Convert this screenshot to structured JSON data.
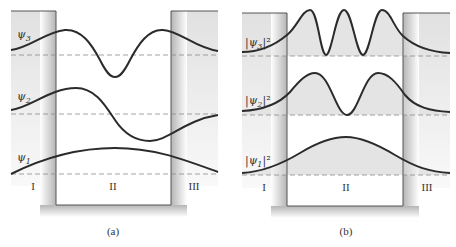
{
  "figure": {
    "panels": [
      {
        "id": "a",
        "caption": "(a)",
        "regions": [
          "I",
          "II",
          "III"
        ],
        "curves": [
          {
            "label": "ψ3",
            "label_main": "ψ",
            "label_sub": "3",
            "description": "third wavefunction, two nodes in well"
          },
          {
            "label": "ψ2",
            "label_main": "ψ",
            "label_sub": "2",
            "description": "second wavefunction, one node in well"
          },
          {
            "label": "ψ1",
            "label_main": "ψ",
            "label_sub": "1",
            "description": "ground-state wavefunction, no nodes"
          }
        ]
      },
      {
        "id": "b",
        "caption": "(b)",
        "regions": [
          "I",
          "II",
          "III"
        ],
        "curves": [
          {
            "label": "|ψ3|²",
            "label_main": "|ψ",
            "label_sub": "3",
            "label_sup": "|²",
            "description": "probability density, three peaks"
          },
          {
            "label": "|ψ2|²",
            "label_main": "|ψ",
            "label_sub": "2",
            "label_sup": "|²",
            "description": "probability density, two peaks"
          },
          {
            "label": "|ψ1|²",
            "label_main": "|ψ",
            "label_sub": "1",
            "label_sup": "|²",
            "description": "probability density, one peak"
          }
        ]
      }
    ],
    "colors": {
      "curve": "#2b2b2b",
      "dashed_baseline": "#8a8a8a",
      "well_shadow": "#bdbdbd",
      "fill_density": "#e6e6e6",
      "box_outline": "#555555"
    }
  }
}
